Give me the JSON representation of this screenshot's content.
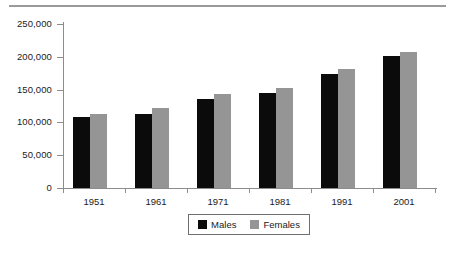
{
  "figure": {
    "top_rule": "horizontal-rule"
  },
  "chart_data": {
    "type": "bar",
    "title": "",
    "subtitle": "",
    "xlabel": "",
    "ylabel": "",
    "categories": [
      "1951",
      "1961",
      "1971",
      "1981",
      "1991",
      "2001"
    ],
    "series": [
      {
        "name": "Males",
        "color": "#0b0b0b",
        "values": [
          108000,
          113000,
          136000,
          145000,
          174000,
          201000
        ]
      },
      {
        "name": "Females",
        "color": "#959595",
        "values": [
          113000,
          122000,
          143000,
          152000,
          181000,
          208000
        ]
      }
    ],
    "ylim": [
      0,
      250000
    ],
    "yticks": [
      0,
      50000,
      100000,
      150000,
      200000,
      250000
    ],
    "ytick_labels": [
      "0",
      "50,000",
      "100,000",
      "150,000",
      "200,000",
      "250,000"
    ],
    "xtick_labels": [
      "1951",
      "1961",
      "1971",
      "1981",
      "1991",
      "2001"
    ],
    "grid": false,
    "legend": {
      "position": "bottom-center",
      "entries": [
        {
          "label": "Males",
          "swatch": "black-square-swatch"
        },
        {
          "label": "Females",
          "swatch": "gray-square-swatch"
        }
      ]
    }
  }
}
